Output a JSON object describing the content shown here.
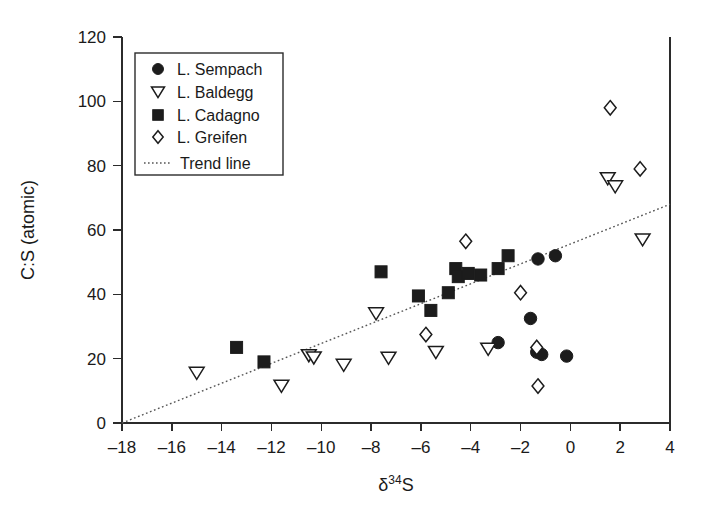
{
  "chart_data": {
    "type": "scatter",
    "title": "",
    "xlabel": "δ³⁴S",
    "ylabel": "C:S (atomic)",
    "xlim": [
      -18,
      4
    ],
    "ylim": [
      0,
      120
    ],
    "xticks": [
      -18,
      -16,
      -14,
      -12,
      -10,
      -8,
      -6,
      -4,
      -2,
      0,
      2,
      4
    ],
    "xtick_labels": [
      "–18",
      "–16",
      "–14",
      "–12",
      "–10",
      "–8",
      "–6",
      "–4",
      "–2",
      "0",
      "2",
      "4"
    ],
    "yticks": [
      0,
      20,
      40,
      60,
      80,
      100,
      120
    ],
    "ytick_labels": [
      "0",
      "20",
      "40",
      "60",
      "80",
      "100",
      "120"
    ],
    "grid": false,
    "legend_position": "upper-left",
    "series": [
      {
        "name": "L. Sempach",
        "marker": "filled-circle",
        "color": "#1c1c1c",
        "points": [
          {
            "x": -2.9,
            "y": 25.0
          },
          {
            "x": -1.6,
            "y": 32.5
          },
          {
            "x": -1.35,
            "y": 22.0
          },
          {
            "x": -1.15,
            "y": 21.3
          },
          {
            "x": -1.3,
            "y": 51.0
          },
          {
            "x": -0.6,
            "y": 52.0
          },
          {
            "x": -0.15,
            "y": 20.8
          }
        ]
      },
      {
        "name": "L. Baldegg",
        "marker": "open-triangle-down",
        "color": "#1c1c1c",
        "points": [
          {
            "x": -15.0,
            "y": 15.5
          },
          {
            "x": -11.6,
            "y": 11.5
          },
          {
            "x": -10.5,
            "y": 21.0
          },
          {
            "x": -10.3,
            "y": 20.3
          },
          {
            "x": -9.1,
            "y": 18.0
          },
          {
            "x": -7.8,
            "y": 34.0
          },
          {
            "x": -7.3,
            "y": 20.2
          },
          {
            "x": -5.4,
            "y": 22.0
          },
          {
            "x": -3.3,
            "y": 23.0
          },
          {
            "x": 1.5,
            "y": 76.0
          },
          {
            "x": 1.8,
            "y": 73.5
          },
          {
            "x": 2.9,
            "y": 57.0
          }
        ]
      },
      {
        "name": "L. Cadagno",
        "marker": "filled-square",
        "color": "#1c1c1c",
        "points": [
          {
            "x": -13.4,
            "y": 23.5
          },
          {
            "x": -12.3,
            "y": 19.0
          },
          {
            "x": -7.6,
            "y": 47.0
          },
          {
            "x": -6.1,
            "y": 39.5
          },
          {
            "x": -5.6,
            "y": 35.0
          },
          {
            "x": -4.9,
            "y": 40.5
          },
          {
            "x": -4.6,
            "y": 48.0
          },
          {
            "x": -4.5,
            "y": 45.5
          },
          {
            "x": -4.1,
            "y": 46.5
          },
          {
            "x": -3.6,
            "y": 46.0
          },
          {
            "x": -2.9,
            "y": 48.0
          },
          {
            "x": -2.5,
            "y": 52.0
          }
        ]
      },
      {
        "name": "L. Greifen",
        "marker": "open-diamond",
        "color": "#1c1c1c",
        "points": [
          {
            "x": -5.8,
            "y": 27.5
          },
          {
            "x": -4.2,
            "y": 56.5
          },
          {
            "x": -2.0,
            "y": 40.5
          },
          {
            "x": -1.35,
            "y": 23.5
          },
          {
            "x": -1.3,
            "y": 11.5
          },
          {
            "x": 1.6,
            "y": 98.0
          },
          {
            "x": 2.8,
            "y": 79.0
          }
        ]
      }
    ],
    "trend_line": {
      "name": "Trend line",
      "style": "dotted",
      "color": "#555555",
      "x0": -18.0,
      "y0": 0.0,
      "x1": 4.0,
      "y1": 68.0
    }
  },
  "legend": {
    "entries": [
      {
        "label": "L. Sempach",
        "marker": "filled-circle"
      },
      {
        "label": "L. Baldegg",
        "marker": "open-triangle-down"
      },
      {
        "label": "L. Cadagno",
        "marker": "filled-square"
      },
      {
        "label": "L. Greifen",
        "marker": "open-diamond"
      }
    ],
    "trend_label": "Trend line"
  }
}
